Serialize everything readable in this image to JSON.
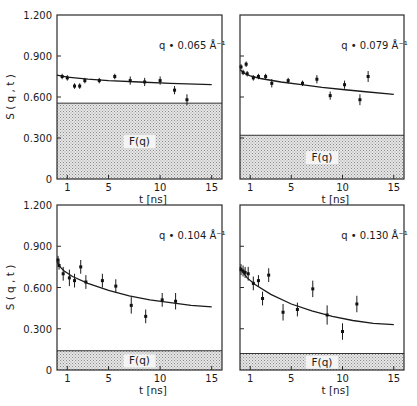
{
  "chart_data": [
    {
      "type": "scatter",
      "panel": "top-left",
      "title": "q = 0.065 Å⁻¹",
      "xlabel": "",
      "ylabel": "S(q,t)",
      "xlim": [
        0,
        16
      ],
      "ylim": [
        0,
        1.2
      ],
      "xticks": [
        "1",
        "5",
        "10",
        "15"
      ],
      "yticks": [
        "0",
        "0.300",
        "0.600",
        "0.900",
        "1.200"
      ],
      "band_label": "F(q)",
      "band_value": 0.555,
      "series": [
        {
          "name": "data",
          "x": [
            0.5,
            1.0,
            1.7,
            2.2,
            2.7,
            4.1,
            5.6,
            7.1,
            8.5,
            10.0,
            11.4,
            12.6
          ],
          "y": [
            0.75,
            0.74,
            0.68,
            0.68,
            0.72,
            0.72,
            0.75,
            0.72,
            0.71,
            0.72,
            0.65,
            0.58
          ],
          "err": [
            0.02,
            0.02,
            0.02,
            0.02,
            0.02,
            0.02,
            0.02,
            0.03,
            0.03,
            0.03,
            0.03,
            0.04
          ]
        },
        {
          "name": "fit",
          "x": [
            0,
            1,
            3,
            5,
            8,
            11,
            15
          ],
          "y": [
            0.76,
            0.745,
            0.73,
            0.72,
            0.71,
            0.7,
            0.69
          ]
        }
      ]
    },
    {
      "type": "scatter",
      "panel": "top-right",
      "title": "q = 0.079 Å⁻¹",
      "xlabel": "",
      "ylabel": "",
      "xlim": [
        0,
        16
      ],
      "ylim": [
        0,
        1.2
      ],
      "xticks": [
        "1",
        "5",
        "10",
        "15"
      ],
      "yticks": [],
      "band_label": "F(q)",
      "band_value": 0.32,
      "series": [
        {
          "name": "data",
          "x": [
            0.1,
            0.3,
            0.6,
            0.7,
            1.3,
            1.8,
            2.5,
            3.1,
            4.7,
            6.1,
            7.5,
            8.8,
            10.2,
            11.7,
            12.5
          ],
          "y": [
            0.82,
            0.78,
            0.84,
            0.77,
            0.74,
            0.75,
            0.75,
            0.7,
            0.72,
            0.7,
            0.73,
            0.61,
            0.69,
            0.58,
            0.75
          ],
          "err": [
            0.02,
            0.02,
            0.02,
            0.02,
            0.02,
            0.02,
            0.02,
            0.03,
            0.02,
            0.02,
            0.03,
            0.03,
            0.03,
            0.04,
            0.04
          ]
        },
        {
          "name": "fit",
          "x": [
            0,
            0.5,
            1,
            2,
            4,
            6,
            8,
            10,
            12,
            15
          ],
          "y": [
            0.8,
            0.77,
            0.755,
            0.735,
            0.71,
            0.69,
            0.67,
            0.655,
            0.64,
            0.62
          ]
        }
      ]
    },
    {
      "type": "scatter",
      "panel": "bottom-left",
      "title": "q = 0.104 Å⁻¹",
      "xlabel": "t [ns]",
      "ylabel": "S(q,t)",
      "xlim": [
        0,
        16
      ],
      "ylim": [
        0,
        1.2
      ],
      "xticks": [
        "1",
        "5",
        "10",
        "15"
      ],
      "yticks": [
        "0",
        "0.300",
        "0.600",
        "0.900",
        "1.200"
      ],
      "band_label": "F(q)",
      "band_value": 0.14,
      "series": [
        {
          "name": "data",
          "x": [
            0.1,
            0.2,
            0.6,
            1.2,
            1.7,
            2.3,
            2.8,
            4.4,
            5.7,
            7.2,
            8.6,
            10.2,
            11.5
          ],
          "y": [
            0.8,
            0.76,
            0.7,
            0.67,
            0.65,
            0.75,
            0.64,
            0.65,
            0.61,
            0.47,
            0.39,
            0.51,
            0.5
          ],
          "err": [
            0.03,
            0.03,
            0.05,
            0.06,
            0.05,
            0.05,
            0.05,
            0.05,
            0.05,
            0.06,
            0.05,
            0.05,
            0.06
          ]
        },
        {
          "name": "fit",
          "x": [
            0,
            0.3,
            0.7,
            1.5,
            3,
            5,
            7,
            9,
            11,
            13,
            15
          ],
          "y": [
            0.79,
            0.75,
            0.72,
            0.68,
            0.63,
            0.58,
            0.54,
            0.51,
            0.49,
            0.47,
            0.46
          ]
        }
      ]
    },
    {
      "type": "scatter",
      "panel": "bottom-right",
      "title": "q = 0.130 Å⁻¹",
      "xlabel": "t [ns]",
      "ylabel": "",
      "xlim": [
        0,
        16
      ],
      "ylim": [
        0,
        1.2
      ],
      "xticks": [
        "1",
        "5",
        "10",
        "15"
      ],
      "yticks": [],
      "band_label": "F(q)",
      "band_value": 0.12,
      "series": [
        {
          "name": "data",
          "x": [
            0.1,
            0.3,
            0.5,
            0.8,
            1.3,
            1.8,
            2.2,
            2.8,
            4.2,
            5.6,
            7.1,
            8.5,
            10.0,
            11.4
          ],
          "y": [
            0.73,
            0.72,
            0.71,
            0.7,
            0.63,
            0.65,
            0.52,
            0.69,
            0.42,
            0.44,
            0.59,
            0.4,
            0.28,
            0.48
          ],
          "err": [
            0.04,
            0.04,
            0.04,
            0.05,
            0.05,
            0.04,
            0.05,
            0.05,
            0.06,
            0.05,
            0.06,
            0.07,
            0.06,
            0.06
          ]
        },
        {
          "name": "fit",
          "x": [
            0,
            0.3,
            0.7,
            1.5,
            3,
            5,
            7,
            9,
            11,
            13,
            15
          ],
          "y": [
            0.75,
            0.71,
            0.67,
            0.62,
            0.55,
            0.48,
            0.43,
            0.39,
            0.36,
            0.34,
            0.33
          ]
        }
      ]
    }
  ]
}
